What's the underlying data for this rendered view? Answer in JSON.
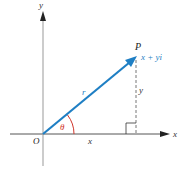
{
  "diagram": {
    "type": "complex-plane-polar-form",
    "axes": {
      "x_label": "x",
      "y_label": "y"
    },
    "origin_label": "O",
    "point_label": "P",
    "point_value": "x + yi",
    "vector_label": "r",
    "angle_label": "θ",
    "horizontal_leg_label": "x",
    "vertical_leg_label": "y",
    "colors": {
      "vector": "#1f7fc4",
      "angle": "#d0352b",
      "axes": "#555555",
      "text": "#222222"
    }
  }
}
